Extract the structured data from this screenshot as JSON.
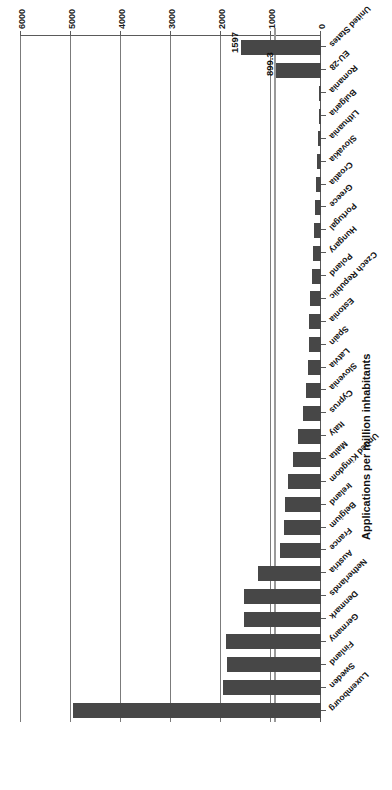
{
  "chart_data": {
    "type": "bar",
    "orientation": "horizontal",
    "title": "",
    "xlabel": "Applications per million inhabitants",
    "ylabel": "",
    "xlim": [
      0,
      6000
    ],
    "xticks": [
      "0",
      "1000",
      "2000",
      "3000",
      "4000",
      "5000",
      "6000"
    ],
    "grid": true,
    "legend": "none",
    "bar_color": "#474747",
    "reference_line_color": "#9a9a9a",
    "axis_color": "#5a5a5a",
    "categories": [
      "Luxembourg",
      "Sweden",
      "Finland",
      "Germany",
      "Denmark",
      "Netherlands",
      "Austria",
      "France",
      "Belgium",
      "Ireland",
      "United Kingdom",
      "Malta",
      "Italy",
      "Cyprus",
      "Slovenia",
      "Latvia",
      "Spain",
      "Estonia",
      "Czech Republic",
      "Poland",
      "Hungary",
      "Portugal",
      "Greece",
      "Croatia",
      "Slovakia",
      "Lithuania",
      "Bulgaria",
      "Romania",
      "EU-28",
      "United States"
    ],
    "values": [
      4950,
      1960,
      1880,
      1900,
      1540,
      1530,
      1250,
      810,
      740,
      720,
      650,
      560,
      460,
      350,
      300,
      260,
      240,
      230,
      210,
      175,
      160,
      130,
      115,
      95,
      80,
      65,
      45,
      32,
      899.3,
      1597
    ],
    "annotations": [
      {
        "category": "EU-28",
        "label": "899.3"
      },
      {
        "category": "United States",
        "label": "1597"
      }
    ],
    "reference_line_value": 899.3
  }
}
